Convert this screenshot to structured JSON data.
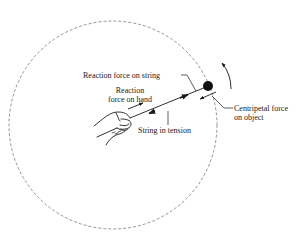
{
  "diagram": {
    "type": "physics-force-diagram",
    "labels": {
      "reaction_on_string": "Reaction force on string",
      "reaction_on_hand_line1": "Reaction",
      "reaction_on_hand_line2": "force on hand",
      "string_tension": "String in tension",
      "centripetal_line1": "Centripetal force",
      "centripetal_line2": "on object"
    },
    "elements": [
      {
        "id": "orbit-path",
        "kind": "dashed-circle",
        "center": [
          113,
          125
        ],
        "radius": 104
      },
      {
        "id": "hand",
        "kind": "illustration",
        "position": [
          105,
          124
        ]
      },
      {
        "id": "string",
        "kind": "line",
        "from": [
          130,
          118
        ],
        "to": [
          208,
          86
        ]
      },
      {
        "id": "object",
        "kind": "filled-circle",
        "center": [
          208,
          86
        ],
        "radius": 5
      },
      {
        "id": "rotation-arrow",
        "kind": "curved-arrow",
        "direction": "counterclockwise"
      },
      {
        "id": "reaction-on-hand-arrow",
        "kind": "arrow",
        "direction": "outward"
      },
      {
        "id": "reaction-on-string-arrow",
        "kind": "arrow",
        "direction": "outward"
      },
      {
        "id": "tension-arrow",
        "kind": "arrow",
        "direction": "inward"
      },
      {
        "id": "centripetal-arrow",
        "kind": "arrow",
        "direction": "inward"
      }
    ],
    "colors": {
      "ink": "#1a1a1a",
      "dashed": "#7a7a7a",
      "background": "#ffffff"
    }
  }
}
